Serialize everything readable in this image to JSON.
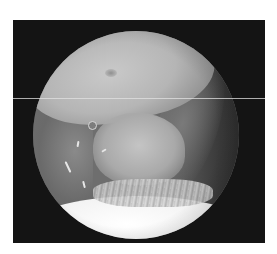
{
  "image": {
    "kind": "arthroscopic-view",
    "colormode": "grayscale",
    "description": "Circular endoscopic field of view on black background showing a pale central tissue mass, frayed fibrous tissue, and a bright white surface below",
    "colors": {
      "page_background": "#ffffff",
      "frame_background": "#141414",
      "tissue_mid": "#6e6e6e",
      "tissue_bright": "#f2f2f2"
    },
    "regions": [
      {
        "name": "upper-tissue-fold",
        "tone": "light-gray"
      },
      {
        "name": "right-side-wall",
        "tone": "dark-gray"
      },
      {
        "name": "central-pale-mass",
        "tone": "light-gray"
      },
      {
        "name": "frayed-fibrous-tissue",
        "tone": "white-streaked"
      },
      {
        "name": "bottom-bright-surface",
        "tone": "white"
      }
    ],
    "artifacts": [
      "horizontal-scan-line"
    ]
  }
}
